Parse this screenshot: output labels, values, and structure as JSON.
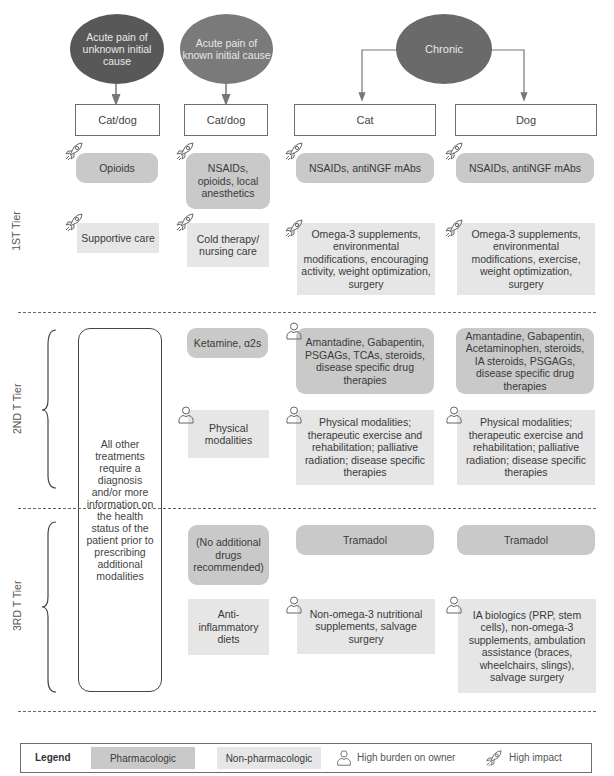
{
  "columns": {
    "acute_unknown": {
      "oval_label": "Acute pain of unknown initial cause",
      "header": "Cat/dog",
      "color": "#585858"
    },
    "acute_known": {
      "oval_label": "Acute pain of known initial cause",
      "header": "Cat/dog",
      "color": "#7a7a7a"
    },
    "chronic": {
      "oval_label": "Chronic",
      "color": "#6a6a6a",
      "cat_header": "Cat",
      "dog_header": "Dog"
    }
  },
  "tiers": {
    "first": {
      "label": "1ST Tier",
      "acute_unknown": {
        "pharm": "Opioids",
        "nonpharm": "Supportive care"
      },
      "acute_known": {
        "pharm": "NSAIDs, opioids, local anesthetics",
        "nonpharm": "Cold therapy/ nursing care"
      },
      "cat": {
        "pharm": "NSAIDs, antiNGF mAbs",
        "nonpharm": "Omega-3 supplements, environmental modifications, encouraging activity, weight optimization, surgery"
      },
      "dog": {
        "pharm": "NSAIDs, antiNGF mAbs",
        "nonpharm": "Omega-3 supplements, environmental modifications, exercise, weight optimization, surgery"
      }
    },
    "second": {
      "label": "2ND T Tier",
      "acute_known": {
        "pharm": "Ketamine, α2s",
        "nonpharm": "Physical modalities"
      },
      "cat": {
        "pharm": "Amantadine, Gabapentin, PSGAGs, TCAs, steroids, disease specific drug therapies",
        "nonpharm": "Physical modalities; therapeutic exercise and rehabilitation; palliative radiation; disease specific therapies"
      },
      "dog": {
        "pharm": "Amantadine, Gabapentin, Acetaminophen, steroids, IA steroids, PSGAGs, disease specific drug therapies",
        "nonpharm": "Physical modalities; therapeutic exercise and rehabilitation; palliative radiation; disease specific therapies"
      }
    },
    "third": {
      "label": "3RD T Tier",
      "acute_known": {
        "pharm": "(No additional drugs recommended)",
        "nonpharm": "Anti-inflammatory diets"
      },
      "cat": {
        "pharm": "Tramadol",
        "nonpharm": "Non-omega-3 nutritional supplements, salvage surgery"
      },
      "dog": {
        "pharm": "Tramadol",
        "nonpharm": "IA biologics (PRP, stem cells), non-omega-3 supplements, ambulation assistance (braces, wheelchairs, slings), salvage surgery"
      }
    }
  },
  "acute_unknown_note": "All other treatments require a diagnosis and/or more information on the health status of the patient prior to prescribing additional modalities",
  "legend": {
    "title": "Legend",
    "pharm": "Pharmacologic",
    "nonpharm": "Non-pharmacologic",
    "burden": "High burden on owner",
    "impact": "High impact"
  },
  "colors": {
    "pharmacologic": "#c9c9c9",
    "non_pharmacologic": "#e6e6e6"
  }
}
